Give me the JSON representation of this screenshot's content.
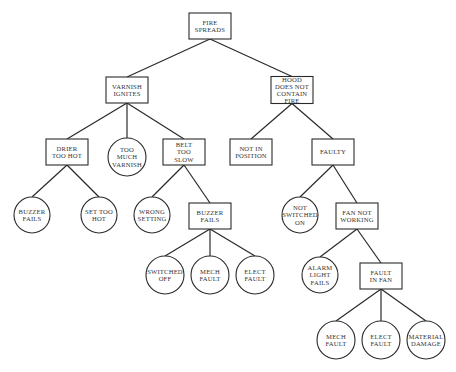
{
  "diagram": {
    "type": "fault-tree",
    "colors": {
      "stroke": "#2a2a2a",
      "text": "#333333",
      "background": "#ffffff"
    },
    "nodes": [
      {
        "id": "fire_spreads",
        "shape": "box",
        "lines": [
          "FIRE",
          "SPREADS"
        ],
        "x": 210,
        "y": 26,
        "w": 42,
        "h": 26
      },
      {
        "id": "varnish_ignites",
        "shape": "box",
        "lines": [
          "VARNISH",
          "IGNITES"
        ],
        "x": 127,
        "y": 90,
        "w": 42,
        "h": 26
      },
      {
        "id": "hood_not_contain",
        "shape": "box",
        "lines": [
          "HOOD",
          "DOES NOT",
          "CONTAIN",
          "FIRE"
        ],
        "x": 292,
        "y": 90,
        "w": 42,
        "h": 27
      },
      {
        "id": "drier_too_hot",
        "shape": "box",
        "lines": [
          "DRIER",
          "TOO HOT"
        ],
        "x": 67,
        "y": 152,
        "w": 42,
        "h": 26
      },
      {
        "id": "too_much_varnish",
        "shape": "circle",
        "lines": [
          "TOO",
          "MUCH",
          "VARNISH"
        ],
        "x": 127,
        "y": 157,
        "r": 19
      },
      {
        "id": "belt_too_slow",
        "shape": "box",
        "lines": [
          "BELT",
          "TOO",
          "SLOW"
        ],
        "x": 184,
        "y": 152,
        "w": 42,
        "h": 26
      },
      {
        "id": "not_in_position",
        "shape": "box",
        "lines": [
          "NOT IN",
          "POSITION"
        ],
        "x": 251,
        "y": 152,
        "w": 42,
        "h": 26
      },
      {
        "id": "faulty",
        "shape": "box",
        "lines": [
          "FAULTY"
        ],
        "x": 333,
        "y": 152,
        "w": 42,
        "h": 26
      },
      {
        "id": "buzzer_fails_1",
        "shape": "circle",
        "lines": [
          "BUZZER",
          "FAILS"
        ],
        "x": 32,
        "y": 215,
        "r": 18
      },
      {
        "id": "set_too_hot",
        "shape": "circle",
        "lines": [
          "SET TOO",
          "HOT"
        ],
        "x": 99,
        "y": 215,
        "r": 18
      },
      {
        "id": "wrong_setting",
        "shape": "circle",
        "lines": [
          "WRONG",
          "SETTING"
        ],
        "x": 152,
        "y": 215,
        "r": 18
      },
      {
        "id": "buzzer_fails_2",
        "shape": "box",
        "lines": [
          "BUZZER",
          "FAILS"
        ],
        "x": 210,
        "y": 216,
        "w": 42,
        "h": 26
      },
      {
        "id": "not_switched_on",
        "shape": "circle",
        "lines": [
          "NOT",
          "SWITCHED",
          "ON"
        ],
        "x": 300,
        "y": 215,
        "r": 18
      },
      {
        "id": "fan_not_working",
        "shape": "box",
        "lines": [
          "FAN NOT",
          "WORKING"
        ],
        "x": 357,
        "y": 216,
        "w": 42,
        "h": 26
      },
      {
        "id": "switched_off",
        "shape": "circle",
        "lines": [
          "SWITCHED",
          "OFF"
        ],
        "x": 165,
        "y": 275,
        "r": 19
      },
      {
        "id": "mech_fault_1",
        "shape": "circle",
        "lines": [
          "MECH",
          "FAULT"
        ],
        "x": 210,
        "y": 275,
        "r": 19
      },
      {
        "id": "elect_fault_1",
        "shape": "circle",
        "lines": [
          "ELECT",
          "FAULT"
        ],
        "x": 255,
        "y": 275,
        "r": 19
      },
      {
        "id": "alarm_light_fails",
        "shape": "circle",
        "lines": [
          "ALARM",
          "LIGHT",
          "FAILS"
        ],
        "x": 320,
        "y": 275,
        "r": 18
      },
      {
        "id": "fault_in_fan",
        "shape": "box",
        "lines": [
          "FAULT",
          "IN FAN"
        ],
        "x": 381,
        "y": 276,
        "w": 42,
        "h": 26
      },
      {
        "id": "mech_fault_2",
        "shape": "circle",
        "lines": [
          "MECH",
          "FAULT"
        ],
        "x": 336,
        "y": 340,
        "r": 19
      },
      {
        "id": "elect_fault_2",
        "shape": "circle",
        "lines": [
          "ELECT",
          "FAULT"
        ],
        "x": 381,
        "y": 340,
        "r": 19
      },
      {
        "id": "material_damage",
        "shape": "circle",
        "lines": [
          "MATERIAL",
          "DAMAGE"
        ],
        "x": 426,
        "y": 340,
        "r": 19
      }
    ],
    "edges": [
      [
        "fire_spreads",
        "varnish_ignites"
      ],
      [
        "fire_spreads",
        "hood_not_contain"
      ],
      [
        "varnish_ignites",
        "drier_too_hot"
      ],
      [
        "varnish_ignites",
        "too_much_varnish"
      ],
      [
        "varnish_ignites",
        "belt_too_slow"
      ],
      [
        "hood_not_contain",
        "not_in_position"
      ],
      [
        "hood_not_contain",
        "faulty"
      ],
      [
        "drier_too_hot",
        "buzzer_fails_1"
      ],
      [
        "drier_too_hot",
        "set_too_hot"
      ],
      [
        "belt_too_slow",
        "wrong_setting"
      ],
      [
        "belt_too_slow",
        "buzzer_fails_2"
      ],
      [
        "buzzer_fails_2",
        "switched_off"
      ],
      [
        "buzzer_fails_2",
        "mech_fault_1"
      ],
      [
        "buzzer_fails_2",
        "elect_fault_1"
      ],
      [
        "faulty",
        "not_switched_on"
      ],
      [
        "faulty",
        "fan_not_working"
      ],
      [
        "fan_not_working",
        "alarm_light_fails"
      ],
      [
        "fan_not_working",
        "fault_in_fan"
      ],
      [
        "fault_in_fan",
        "mech_fault_2"
      ],
      [
        "fault_in_fan",
        "elect_fault_2"
      ],
      [
        "fault_in_fan",
        "material_damage"
      ]
    ]
  }
}
